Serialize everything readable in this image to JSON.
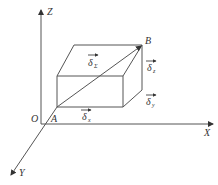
{
  "diagram": {
    "type": "3d-vector-decomposition",
    "axes": {
      "z_label": "Z",
      "x_label": "X",
      "y_label": "Y",
      "origin_label": "O"
    },
    "points": {
      "start_label": "A",
      "end_label": "B"
    },
    "vectors": {
      "sum": {
        "symbol": "δ",
        "subscript": "Σ"
      },
      "x": {
        "symbol": "δ",
        "subscript": "x"
      },
      "y": {
        "symbol": "δ",
        "subscript": "y"
      },
      "z": {
        "symbol": "δ",
        "subscript": "z"
      }
    },
    "colors": {
      "line": "#555555",
      "text": "#333333",
      "background": "#ffffff"
    }
  }
}
